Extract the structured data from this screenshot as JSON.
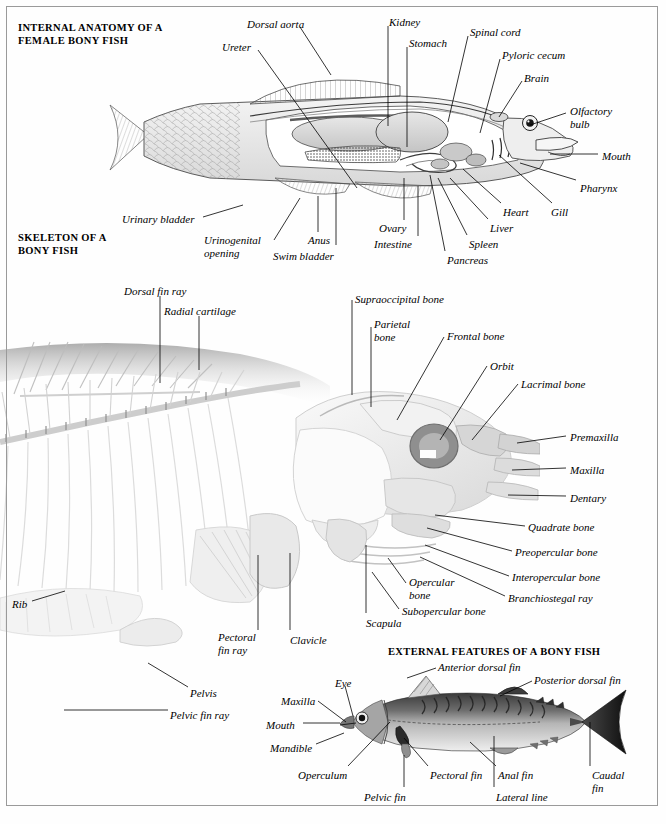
{
  "page": {
    "width": 666,
    "height": 824,
    "background": "#ffffff",
    "frame_color": "#9a9a9a",
    "ink": "#000000"
  },
  "sections": [
    {
      "id": "internal",
      "title": "INTERNAL ANATOMY OF A\nFEMALE BONY FISH",
      "x": 18,
      "y": 22
    },
    {
      "id": "skeleton",
      "title": "SKELETON OF A\nBONY FISH",
      "x": 18,
      "y": 232
    },
    {
      "id": "external",
      "title": "EXTERNAL FEATURES OF A BONY FISH",
      "x": 388,
      "y": 646
    }
  ],
  "internal_anatomy": {
    "labels": [
      {
        "text": "Dorsal aorta",
        "x": 247,
        "y": 18,
        "align": "left",
        "line": [
          [
            300,
            27
          ],
          [
            331,
            75
          ]
        ]
      },
      {
        "text": "Ureter",
        "x": 222,
        "y": 41,
        "align": "left",
        "line": [
          [
            258,
            50
          ],
          [
            357,
            188
          ]
        ]
      },
      {
        "text": "Kidney",
        "x": 389,
        "y": 16,
        "align": "left",
        "line": [
          [
            388,
            26
          ],
          [
            388,
            126
          ]
        ]
      },
      {
        "text": "Stomach",
        "x": 409,
        "y": 37,
        "align": "left",
        "line": [
          [
            407,
            47
          ],
          [
            407,
            147
          ]
        ]
      },
      {
        "text": "Spinal cord",
        "x": 470,
        "y": 26,
        "align": "left",
        "line": [
          [
            468,
            36
          ],
          [
            448,
            122
          ]
        ]
      },
      {
        "text": "Pyloric cecum",
        "x": 502,
        "y": 49,
        "align": "left",
        "line": [
          [
            500,
            59
          ],
          [
            480,
            133
          ]
        ]
      },
      {
        "text": "Brain",
        "x": 524,
        "y": 72,
        "align": "left",
        "line": [
          [
            522,
            81
          ],
          [
            499,
            117
          ]
        ]
      },
      {
        "text": "Olfactory\nbulb",
        "x": 570,
        "y": 105,
        "align": "left",
        "line": [
          [
            566,
            113
          ],
          [
            530,
            125
          ]
        ]
      },
      {
        "text": "Mouth",
        "x": 602,
        "y": 150,
        "align": "left",
        "line": [
          [
            598,
            154
          ],
          [
            550,
            154
          ]
        ]
      },
      {
        "text": "Pharynx",
        "x": 580,
        "y": 182,
        "align": "left",
        "line": [
          [
            576,
            180
          ],
          [
            520,
            163
          ]
        ]
      },
      {
        "text": "Gill",
        "x": 551,
        "y": 206,
        "align": "left",
        "line": [
          [
            552,
            203
          ],
          [
            499,
            155
          ]
        ]
      },
      {
        "text": "Heart",
        "x": 503,
        "y": 206,
        "align": "left",
        "line": [
          [
            501,
            203
          ],
          [
            463,
            169
          ]
        ]
      },
      {
        "text": "Liver",
        "x": 490,
        "y": 222,
        "align": "left",
        "line": [
          [
            488,
            219
          ],
          [
            450,
            178
          ]
        ]
      },
      {
        "text": "Spleen",
        "x": 469,
        "y": 238,
        "align": "left",
        "line": [
          [
            467,
            235
          ],
          [
            438,
            178
          ]
        ]
      },
      {
        "text": "Pancreas",
        "x": 447,
        "y": 254,
        "align": "left",
        "line": [
          [
            445,
            251
          ],
          [
            430,
            175
          ]
        ]
      },
      {
        "text": "Intestine",
        "x": 374,
        "y": 238,
        "align": "left",
        "line": [
          [
            418,
            236
          ],
          [
            418,
            186
          ]
        ]
      },
      {
        "text": "Ovary",
        "x": 379,
        "y": 222,
        "align": "left",
        "line": [
          [
            404,
            220
          ],
          [
            404,
            178
          ]
        ]
      },
      {
        "text": "Swim bladder",
        "x": 273,
        "y": 250,
        "align": "left",
        "line": [
          [
            336,
            245
          ],
          [
            336,
            188
          ]
        ]
      },
      {
        "text": "Anus",
        "x": 308,
        "y": 234,
        "align": "left",
        "line": [
          [
            318,
            232
          ],
          [
            318,
            196
          ]
        ]
      },
      {
        "text": "Urinogenital\nopening",
        "x": 204,
        "y": 234,
        "align": "left",
        "line": [
          [
            274,
            240
          ],
          [
            300,
            198
          ]
        ]
      },
      {
        "text": "Urinary bladder",
        "x": 122,
        "y": 213,
        "align": "left",
        "line": [
          [
            203,
            217
          ],
          [
            243,
            205
          ]
        ]
      }
    ]
  },
  "skeleton": {
    "labels": [
      {
        "text": "Dorsal fin ray",
        "x": 124,
        "y": 285,
        "align": "left",
        "line": [
          [
            160,
            296
          ],
          [
            160,
            383
          ]
        ]
      },
      {
        "text": "Radial cartilage",
        "x": 164,
        "y": 305,
        "align": "left",
        "line": [
          [
            199,
            316
          ],
          [
            199,
            370
          ]
        ]
      },
      {
        "text": "Supraoccipital bone",
        "x": 355,
        "y": 293,
        "align": "left",
        "line": [
          [
            352,
            300
          ],
          [
            352,
            395
          ]
        ]
      },
      {
        "text": "Parietal\nbone",
        "x": 374,
        "y": 318,
        "align": "left",
        "line": [
          [
            371,
            327
          ],
          [
            371,
            407
          ]
        ]
      },
      {
        "text": "Frontal bone",
        "x": 447,
        "y": 330,
        "align": "left",
        "line": [
          [
            444,
            337
          ],
          [
            397,
            420
          ]
        ]
      },
      {
        "text": "Orbit",
        "x": 490,
        "y": 360,
        "align": "left",
        "line": [
          [
            487,
            366
          ],
          [
            440,
            440
          ]
        ]
      },
      {
        "text": "Lacrimal bone",
        "x": 521,
        "y": 378,
        "align": "left",
        "line": [
          [
            518,
            384
          ],
          [
            472,
            440
          ]
        ]
      },
      {
        "text": "Premaxilla",
        "x": 570,
        "y": 431,
        "align": "left",
        "line": [
          [
            566,
            436
          ],
          [
            517,
            443
          ]
        ]
      },
      {
        "text": "Maxilla",
        "x": 570,
        "y": 464,
        "align": "left",
        "line": [
          [
            566,
            468
          ],
          [
            512,
            470
          ]
        ]
      },
      {
        "text": "Dentary",
        "x": 570,
        "y": 492,
        "align": "left",
        "line": [
          [
            566,
            496
          ],
          [
            508,
            495
          ]
        ]
      },
      {
        "text": "Quadrate bone",
        "x": 528,
        "y": 521,
        "align": "left",
        "line": [
          [
            525,
            526
          ],
          [
            435,
            515
          ]
        ]
      },
      {
        "text": "Preopercular bone",
        "x": 515,
        "y": 546,
        "align": "left",
        "line": [
          [
            512,
            551
          ],
          [
            427,
            528
          ]
        ]
      },
      {
        "text": "Interopercular bone",
        "x": 512,
        "y": 571,
        "align": "left",
        "line": [
          [
            509,
            576
          ],
          [
            425,
            545
          ]
        ]
      },
      {
        "text": "Branchiostegal ray",
        "x": 508,
        "y": 592,
        "align": "left",
        "line": [
          [
            505,
            596
          ],
          [
            420,
            557
          ]
        ]
      },
      {
        "text": "Opercular\nbone",
        "x": 409,
        "y": 576,
        "align": "left",
        "line": [
          [
            406,
            583
          ],
          [
            388,
            558
          ]
        ]
      },
      {
        "text": "Subopercular bone",
        "x": 402,
        "y": 605,
        "align": "left",
        "line": [
          [
            399,
            609
          ],
          [
            372,
            572
          ]
        ]
      },
      {
        "text": "Scapula",
        "x": 366,
        "y": 617,
        "align": "left",
        "line": [
          [
            366,
            613
          ],
          [
            366,
            545
          ]
        ]
      },
      {
        "text": "Clavicle",
        "x": 290,
        "y": 634,
        "align": "left",
        "line": [
          [
            290,
            630
          ],
          [
            290,
            553
          ]
        ]
      },
      {
        "text": "Pectoral\nfin ray",
        "x": 218,
        "y": 631,
        "align": "left",
        "line": [
          [
            258,
            630
          ],
          [
            258,
            555
          ]
        ]
      },
      {
        "text": "Rib",
        "x": 12,
        "y": 598,
        "align": "left",
        "line": [
          [
            32,
            601
          ],
          [
            65,
            591
          ]
        ]
      },
      {
        "text": "Pelvis",
        "x": 190,
        "y": 687,
        "align": "left",
        "line": [
          [
            188,
            687
          ],
          [
            148,
            663
          ]
        ]
      },
      {
        "text": "Pelvic fin ray",
        "x": 170,
        "y": 709,
        "align": "left",
        "line": [
          [
            168,
            710
          ],
          [
            64,
            710
          ]
        ]
      }
    ]
  },
  "external_features": {
    "labels": [
      {
        "text": "Anterior dorsal fin",
        "x": 438,
        "y": 661,
        "align": "left",
        "line": [
          [
            436,
            668
          ],
          [
            407,
            678
          ]
        ]
      },
      {
        "text": "Posterior dorsal fin",
        "x": 534,
        "y": 674,
        "align": "left",
        "line": [
          [
            532,
            681
          ],
          [
            500,
            696
          ]
        ]
      },
      {
        "text": "Eye",
        "x": 335,
        "y": 677,
        "align": "left",
        "line": [
          [
            345,
            686
          ],
          [
            353,
            716
          ]
        ]
      },
      {
        "text": "Maxilla",
        "x": 281,
        "y": 695,
        "align": "left",
        "line": [
          [
            318,
            701
          ],
          [
            346,
            722
          ]
        ]
      },
      {
        "text": "Mouth",
        "x": 266,
        "y": 719,
        "align": "left",
        "line": [
          [
            303,
            723
          ],
          [
            340,
            723
          ]
        ]
      },
      {
        "text": "Mandible",
        "x": 270,
        "y": 742,
        "align": "left",
        "line": [
          [
            316,
            744
          ],
          [
            344,
            733
          ]
        ]
      },
      {
        "text": "Operculum",
        "x": 298,
        "y": 769,
        "align": "left",
        "line": [
          [
            348,
            766
          ],
          [
            390,
            722
          ]
        ]
      },
      {
        "text": "Pelvic fin",
        "x": 364,
        "y": 791,
        "align": "left",
        "line": [
          [
            404,
            787
          ],
          [
            404,
            755
          ]
        ]
      },
      {
        "text": "Pectoral fin",
        "x": 430,
        "y": 769,
        "align": "left",
        "line": [
          [
            428,
            766
          ],
          [
            404,
            738
          ]
        ]
      },
      {
        "text": "Anal fin",
        "x": 498,
        "y": 769,
        "align": "left",
        "line": [
          [
            496,
            766
          ],
          [
            470,
            742
          ]
        ]
      },
      {
        "text": "Lateral line",
        "x": 496,
        "y": 791,
        "align": "left",
        "line": [
          [
            494,
            787
          ],
          [
            494,
            736
          ]
        ]
      },
      {
        "text": "Caudal\nfin",
        "x": 592,
        "y": 769,
        "align": "left",
        "line": [
          [
            590,
            766
          ],
          [
            590,
            722
          ]
        ]
      }
    ]
  }
}
